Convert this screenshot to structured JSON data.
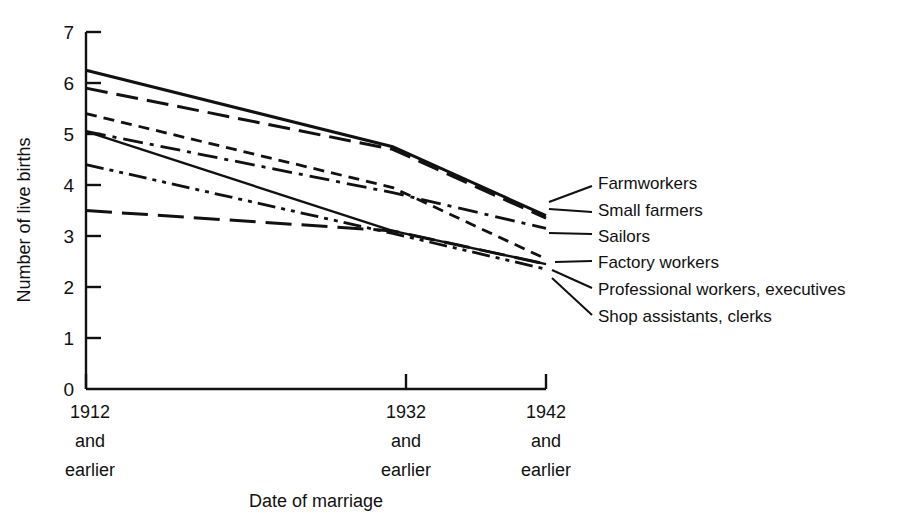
{
  "chart_data": {
    "type": "line",
    "title": "",
    "xlabel": "Date of marriage",
    "ylabel": "Number of live births",
    "x": [
      "1912 and earlier",
      "1932 and earlier",
      "1942 and earlier"
    ],
    "x_positions": [
      1912,
      1932,
      1942
    ],
    "xlim": [
      1908,
      1946
    ],
    "ylim": [
      0,
      7
    ],
    "y_ticks": [
      0,
      1,
      2,
      3,
      4,
      5,
      6,
      7
    ],
    "grid": false,
    "legend_position": "right-inline-labels",
    "series": [
      {
        "name": "Farmworkers",
        "style": "solid",
        "values": [
          6.25,
          4.75,
          3.4
        ]
      },
      {
        "name": "Small farmers",
        "style": "long-dash",
        "values": [
          5.9,
          4.7,
          3.35
        ]
      },
      {
        "name": "Sailors",
        "style": "dash-dot",
        "values": [
          5.05,
          3.85,
          3.15
        ]
      },
      {
        "name": "Factory workers",
        "style": "short-dash",
        "values": [
          5.4,
          3.95,
          2.55
        ]
      },
      {
        "name": "Professional workers, executives",
        "style": "solid-thin",
        "values": [
          5.05,
          3.1,
          2.45
        ]
      },
      {
        "name": "Shop assistants, clerks",
        "style": "dash-dot-dot",
        "values": [
          4.4,
          3.05,
          2.35
        ]
      },
      {
        "name": "Long-dash low series",
        "style": "long-dash-low",
        "values": [
          3.5,
          3.1,
          2.45
        ],
        "hidden_label": true
      }
    ]
  },
  "axes": {
    "y_tick_labels": [
      "0",
      "1",
      "2",
      "3",
      "4",
      "5",
      "6",
      "7"
    ],
    "y_axis_title": "Number of live births",
    "x_axis_title": "Date of marriage",
    "x_groups": [
      {
        "year": "1912",
        "line2": "and",
        "line3": "earlier"
      },
      {
        "year": "1932",
        "line2": "and",
        "line3": "earlier"
      },
      {
        "year": "1942",
        "line2": "and",
        "line3": "earlier"
      }
    ]
  },
  "legend": {
    "items": [
      {
        "label": "Farmworkers"
      },
      {
        "label": "Small farmers"
      },
      {
        "label": "Sailors"
      },
      {
        "label": "Factory workers"
      },
      {
        "label": "Professional workers, executives"
      },
      {
        "label": "Shop assistants, clerks"
      }
    ]
  },
  "colors": {
    "ink": "#111111",
    "background": "#ffffff"
  }
}
